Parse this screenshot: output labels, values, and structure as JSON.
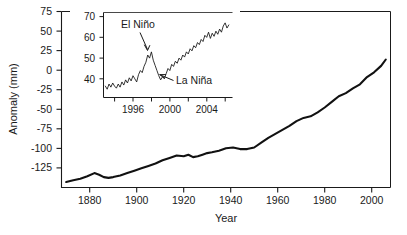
{
  "figure": {
    "background": "#ffffff",
    "line_color": "#111111",
    "text_color": "#1a1a1a"
  },
  "chart_data": {
    "type": "line",
    "title": "",
    "xlabel": "Year",
    "ylabel": "Anomaly (mm)",
    "xlim": [
      1868,
      2008
    ],
    "ylim": [
      -140,
      80
    ],
    "grid": false,
    "legend": null,
    "xticks": [
      1880,
      1900,
      1920,
      1940,
      1960,
      1980,
      2000
    ],
    "xtick_labels": [
      "1880",
      "1900",
      "1920",
      "1940",
      "1960",
      "1980",
      "2000"
    ],
    "yticks": [
      75,
      50,
      25,
      0,
      -25,
      -50,
      -75,
      -100,
      -125
    ],
    "ytick_labels": [
      "75",
      "50",
      "25",
      "0",
      "-25",
      "-50",
      "-75",
      "-100",
      "-125"
    ],
    "series": [
      {
        "name": "Global mean sea level anomaly",
        "x": [
          1870,
          1873,
          1876,
          1879,
          1882,
          1884,
          1886,
          1888,
          1890,
          1893,
          1896,
          1899,
          1902,
          1905,
          1908,
          1911,
          1914,
          1917,
          1920,
          1922,
          1924,
          1926,
          1928,
          1930,
          1932,
          1935,
          1938,
          1941,
          1944,
          1947,
          1950,
          1953,
          1956,
          1959,
          1962,
          1965,
          1968,
          1971,
          1974,
          1977,
          1980,
          1983,
          1986,
          1989,
          1992,
          1995,
          1998,
          2001,
          2004,
          2006
        ],
        "y": [
          -133,
          -131,
          -129,
          -126,
          -122,
          -124,
          -127,
          -128,
          -127,
          -125,
          -122,
          -119,
          -116,
          -113,
          -110,
          -106,
          -103,
          -100,
          -101,
          -99,
          -102,
          -101,
          -99,
          -97,
          -96,
          -94,
          -91,
          -90,
          -92,
          -92,
          -90,
          -84,
          -78,
          -73,
          -68,
          -63,
          -57,
          -53,
          -51,
          -46,
          -40,
          -33,
          -26,
          -22,
          -16,
          -11,
          -2,
          4,
          12,
          20
        ]
      }
    ],
    "inset": {
      "type": "line",
      "title": "",
      "xlabel": "",
      "ylabel": "",
      "xlim": [
        1992.8,
        2006.8
      ],
      "ylim": [
        33,
        74
      ],
      "grid": false,
      "xticks": [
        1994,
        1996,
        1998,
        2000,
        2002,
        2004,
        2006
      ],
      "xtick_labels": [
        "",
        "1996",
        "",
        "2000",
        "",
        "2004",
        ""
      ],
      "yticks": [
        40,
        50,
        60,
        70
      ],
      "ytick_labels": [
        "40",
        "50",
        "60",
        "70"
      ],
      "series": [
        {
          "name": "Satellite altimeter sea level",
          "x": [
            1993.0,
            1993.2,
            1993.4,
            1993.6,
            1993.8,
            1994.0,
            1994.2,
            1994.4,
            1994.6,
            1994.8,
            1995.0,
            1995.2,
            1995.4,
            1995.6,
            1995.8,
            1996.0,
            1996.2,
            1996.4,
            1996.6,
            1996.8,
            1997.0,
            1997.2,
            1997.4,
            1997.6,
            1997.8,
            1998.0,
            1998.2,
            1998.4,
            1998.6,
            1998.8,
            1999.0,
            1999.2,
            1999.4,
            1999.6,
            1999.8,
            2000.0,
            2000.2,
            2000.4,
            2000.6,
            2000.8,
            2001.0,
            2001.2,
            2001.4,
            2001.6,
            2001.8,
            2002.0,
            2002.2,
            2002.4,
            2002.6,
            2002.8,
            2003.0,
            2003.2,
            2003.4,
            2003.6,
            2003.8,
            2004.0,
            2004.2,
            2004.4,
            2004.6,
            2004.8,
            2005.0,
            2005.2,
            2005.4,
            2005.6,
            2005.8,
            2006.0,
            2006.2,
            2006.4
          ],
          "y": [
            38.5,
            37.0,
            39.5,
            38.0,
            40.0,
            38.5,
            37.5,
            39.5,
            38.0,
            40.5,
            39.0,
            41.5,
            40.0,
            42.5,
            41.0,
            43.5,
            42.0,
            40.5,
            44.0,
            46.0,
            45.0,
            48.0,
            50.0,
            53.5,
            52.0,
            55.0,
            51.0,
            48.5,
            46.0,
            43.5,
            41.5,
            43.0,
            42.0,
            44.5,
            47.0,
            46.0,
            49.0,
            48.0,
            50.5,
            49.5,
            52.0,
            51.0,
            53.5,
            52.5,
            55.0,
            54.0,
            56.5,
            55.5,
            58.0,
            57.0,
            59.5,
            58.5,
            61.0,
            60.0,
            63.0,
            62.0,
            64.5,
            61.5,
            64.0,
            62.5,
            65.0,
            63.5,
            66.0,
            64.5,
            67.5,
            69.0,
            66.5,
            68.0
          ]
        }
      ],
      "annotations": [
        {
          "id": "el-nino",
          "label": "El Niño",
          "x": 1997.6,
          "y": 53.5
        },
        {
          "id": "la-nina",
          "label": "La Niña",
          "x": 1999.1,
          "y": 41.5
        }
      ]
    }
  }
}
